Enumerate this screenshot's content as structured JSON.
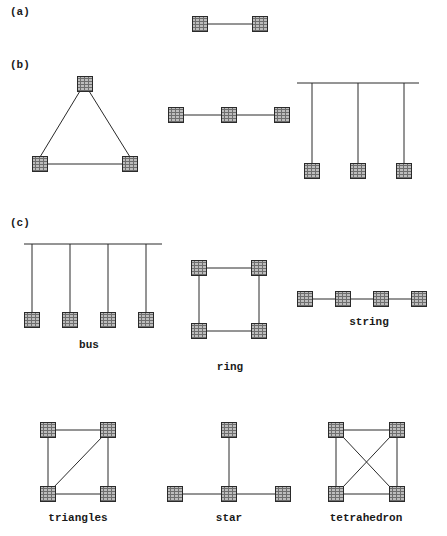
{
  "figure": {
    "panels": [
      {
        "id": "a",
        "label": "(a)"
      },
      {
        "id": "b",
        "label": "(b)"
      },
      {
        "id": "c",
        "label": "(c)"
      }
    ],
    "topology_labels": {
      "bus": "bus",
      "ring": "ring",
      "string": "string",
      "triangles": "triangles",
      "star": "star",
      "tetrahedron": "tetrahedron"
    },
    "colors": {
      "node_fill": "#7a7a7a",
      "node_grid": "#c8c8c8",
      "node_border": "#2a2a2a",
      "edge": "#2a2a2a",
      "background": "#ffffff"
    },
    "node_size": 16
  }
}
